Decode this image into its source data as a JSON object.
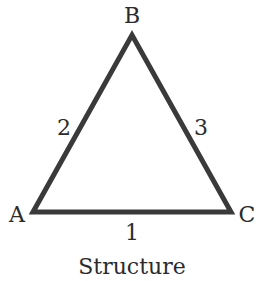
{
  "diagram": {
    "caption": "Structure",
    "vertices": [
      {
        "name": "A",
        "x": 33,
        "y": 212
      },
      {
        "name": "B",
        "x": 132,
        "y": 35
      },
      {
        "name": "C",
        "x": 231,
        "y": 212
      }
    ],
    "edges": [
      {
        "label": "1",
        "from": "A",
        "to": "C"
      },
      {
        "label": "2",
        "from": "A",
        "to": "B"
      },
      {
        "label": "3",
        "from": "B",
        "to": "C"
      }
    ],
    "stroke_color": "#3a3a3a"
  }
}
